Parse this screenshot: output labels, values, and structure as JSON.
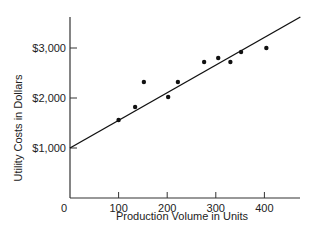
{
  "chart_data": {
    "type": "scatter",
    "title": "",
    "xlabel": "Production Volume in Units",
    "ylabel": "Utility Costs in Dollars",
    "xlim": [
      0,
      470
    ],
    "ylim": [
      0,
      3700
    ],
    "x_ticks": [
      0,
      100,
      200,
      300,
      400
    ],
    "x_tick_labels": [
      "0",
      "100",
      "200",
      "300",
      "400"
    ],
    "y_ticks": [
      1000,
      2000,
      3000
    ],
    "y_tick_labels": [
      "$1,000",
      "$2,000",
      "$3,000"
    ],
    "grid": false,
    "legend": null,
    "series": [
      {
        "name": "Observations",
        "type": "scatter",
        "points": [
          {
            "x": 100,
            "y": 1560
          },
          {
            "x": 134,
            "y": 1820
          },
          {
            "x": 152,
            "y": 2320
          },
          {
            "x": 202,
            "y": 2020
          },
          {
            "x": 222,
            "y": 2320
          },
          {
            "x": 276,
            "y": 2720
          },
          {
            "x": 305,
            "y": 2800
          },
          {
            "x": 330,
            "y": 2720
          },
          {
            "x": 352,
            "y": 2920
          },
          {
            "x": 404,
            "y": 3000
          }
        ]
      },
      {
        "name": "Regression line",
        "type": "line",
        "points": [
          {
            "x": 0,
            "y": 1000
          },
          {
            "x": 474,
            "y": 3620
          }
        ]
      }
    ]
  }
}
